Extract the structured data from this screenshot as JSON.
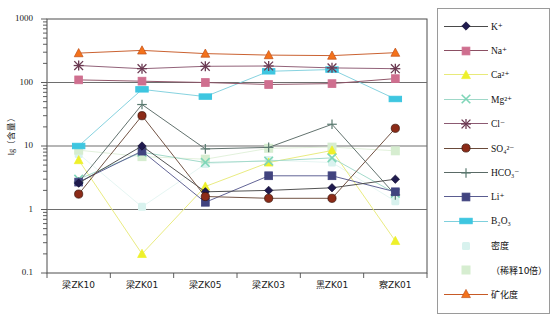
{
  "chart_data": {
    "type": "line",
    "title": "",
    "xlabel": "",
    "ylabel": "lg（含量）",
    "ylim": [
      0.1,
      1000
    ],
    "yscale": "log",
    "grid": true,
    "y_ticks": [
      "1000",
      "100",
      "10",
      "1",
      "0.1"
    ],
    "y_tick_values": [
      1000,
      100,
      10,
      1,
      0.1
    ],
    "legend_position": "right-outside",
    "categories": [
      "梁ZK10",
      "梁ZK01",
      "梁ZK05",
      "梁ZK03",
      "黑ZK01",
      "察ZK01"
    ],
    "series": [
      {
        "name": "K+",
        "label": "K",
        "sup": "+",
        "marker": "diamond",
        "color": "#1f1a4e",
        "line_color": "#4a4a4a",
        "values": [
          2.6,
          10.0,
          1.9,
          2.0,
          2.2,
          3.0
        ]
      },
      {
        "name": "Na+",
        "label": "Na",
        "sup": "+",
        "marker": "square",
        "color": "#cf6f8f",
        "line_color": "#8b4f63",
        "values": [
          110,
          105,
          100,
          93,
          96,
          115
        ]
      },
      {
        "name": "Ca2+",
        "label": "Ca",
        "sup": "2+",
        "marker": "triangle",
        "color": "#eef02a",
        "line_color": "#e8ea7a",
        "values": [
          6.0,
          0.2,
          2.3,
          5.5,
          8.5,
          0.32
        ]
      },
      {
        "name": "Mg2+",
        "label": "Mg",
        "sup": "2+",
        "marker": "cross-x",
        "color": "#7fd6b8",
        "line_color": "#9fd8c8",
        "values": [
          3.0,
          8.0,
          5.5,
          5.8,
          6.5,
          1.8
        ]
      },
      {
        "name": "Cl-",
        "label": "Cl",
        "sup": "-",
        "marker": "star-x",
        "color": "#6b3a52",
        "line_color": "#8c5a72",
        "values": [
          185,
          165,
          180,
          182,
          170,
          165
        ]
      },
      {
        "name": "SO42-",
        "label": "SO",
        "sub": "4",
        "sup": "2-",
        "marker": "circle",
        "color": "#8c2b18",
        "line_color": "#6a4a3a",
        "values": [
          1.75,
          30.0,
          1.6,
          1.5,
          1.5,
          19.0
        ]
      },
      {
        "name": "HCO3-",
        "label": "HCO",
        "sub": "3",
        "sup": "-",
        "marker": "plus",
        "color": "#5a7a70",
        "line_color": "#5a6a66",
        "values": [
          2.7,
          45.0,
          9.0,
          9.5,
          22.0,
          1.7
        ]
      },
      {
        "name": "Li+",
        "label": "Li",
        "sup": "+",
        "marker": "square",
        "color": "#41437f",
        "line_color": "#5a5c90",
        "values": [
          2.7,
          8.3,
          1.3,
          3.4,
          3.4,
          1.9
        ]
      },
      {
        "name": "B2O3",
        "label": "B",
        "sub": "2",
        "label2": "O",
        "sub2": "3",
        "marker": "rect",
        "color": "#3ec6e0",
        "line_color": "#7fd0dd",
        "values": [
          10.0,
          78.0,
          60.0,
          150,
          160,
          55
        ]
      },
      {
        "name": "midu",
        "label": "密度",
        "marker": "soft-dot",
        "color": "#d8f2ee",
        "line_color": "#e4f4f1",
        "values": [
          7.5,
          1.1,
          5.2,
          6.0,
          5.5,
          1.35
        ]
      },
      {
        "name": "xishi10bei",
        "label": "（稀释10倍）",
        "marker": "soft-square",
        "color": "#d6edd0",
        "line_color": "#e0f0da",
        "values": [
          8.6,
          6.8,
          6.2,
          9.2,
          9.6,
          8.4
        ]
      },
      {
        "name": "kuanghuadu",
        "label": "矿化度",
        "marker": "triangle-up",
        "color": "#f4721b",
        "line_color": "#c75a26",
        "values": [
          290,
          320,
          285,
          270,
          265,
          295
        ]
      }
    ]
  },
  "axis": {
    "y_label": "lg（含量）",
    "y_ticks": [
      "1000",
      "100",
      "10",
      "1",
      "0.1"
    ],
    "x_ticks": [
      "梁ZK10",
      "梁ZK01",
      "梁ZK05",
      "梁ZK03",
      "黑ZK01",
      "察ZK01"
    ]
  },
  "legend": {
    "items": [
      {
        "id": "legend-item-k",
        "label": "K⁺"
      },
      {
        "id": "legend-item-na",
        "label": "Na⁺"
      },
      {
        "id": "legend-item-ca",
        "label": "Ca²⁺"
      },
      {
        "id": "legend-item-mg",
        "label": "Mg²⁺"
      },
      {
        "id": "legend-item-cl",
        "label": "Cl⁻"
      },
      {
        "id": "legend-item-so4",
        "label": "SO₄²⁻"
      },
      {
        "id": "legend-item-hco3",
        "label": "HCO₃⁻"
      },
      {
        "id": "legend-item-li",
        "label": "Li⁺"
      },
      {
        "id": "legend-item-b2o3",
        "label": "B₂O₃"
      },
      {
        "id": "legend-item-midu",
        "label": "密度"
      },
      {
        "id": "legend-item-dilution",
        "label": "（稀释10倍）"
      },
      {
        "id": "legend-item-salinity",
        "label": "矿化度"
      }
    ]
  },
  "colors": {
    "k": "#1f1a4e",
    "na": "#cf6f8f",
    "ca": "#eef02a",
    "mg": "#7fd6b8",
    "cl": "#6b3a52",
    "so4": "#8c2b18",
    "hco3": "#5a7a70",
    "li": "#41437f",
    "b2o3": "#3ec6e0",
    "midu": "#d8f2ee",
    "dilution": "#d6edd0",
    "salinity": "#f4721b",
    "axis": "#4d4d4d",
    "grid": "#6e6e6e",
    "legend_border": "#9a9a9a"
  }
}
